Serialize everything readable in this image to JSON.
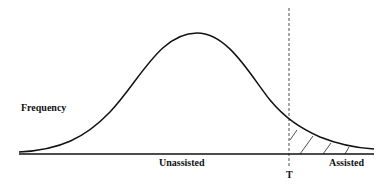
{
  "diagram": {
    "type": "distribution-curve",
    "labels": {
      "y_axis": "Frequency",
      "left_region": "Unassisted",
      "right_region": "Assisted",
      "threshold": "T"
    },
    "colors": {
      "line": "#111111",
      "background": "#ffffff"
    }
  }
}
